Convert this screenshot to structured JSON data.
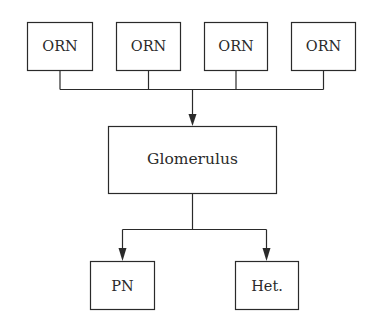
{
  "diagram": {
    "inputs": [
      {
        "label": "ORN"
      },
      {
        "label": "ORN"
      },
      {
        "label": "ORN"
      },
      {
        "label": "ORN"
      }
    ],
    "center": {
      "label": "Glomerulus"
    },
    "outputs": [
      {
        "label": "PN"
      },
      {
        "label": "Het."
      }
    ],
    "colors": {
      "stroke": "#2a2a2a",
      "background": "#ffffff"
    }
  }
}
